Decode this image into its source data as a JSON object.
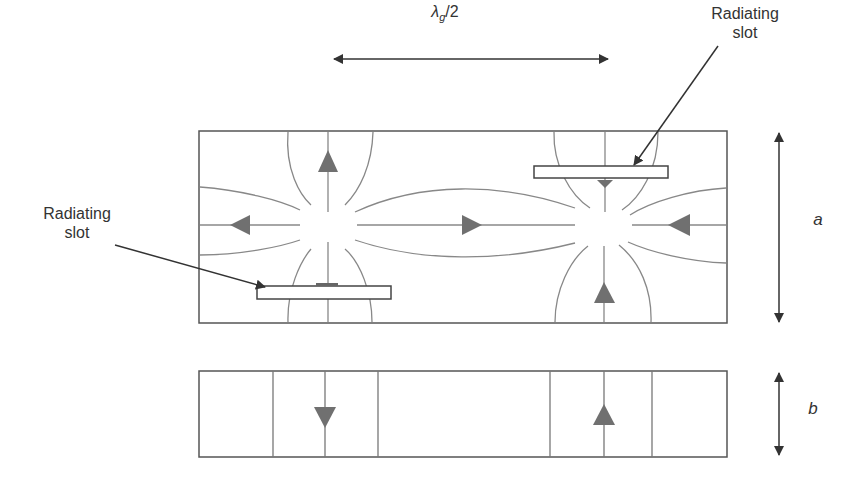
{
  "figure": {
    "labels": {
      "half_wavelength": "λg/2",
      "radiating_slot_right_line1": "Radiating",
      "radiating_slot_right_line2": "slot",
      "radiating_slot_left_line1": "Radiating",
      "radiating_slot_left_line2": "slot",
      "dimension_a": "a",
      "dimension_b": "b"
    },
    "colors": {
      "outline": "#555555",
      "field_lines": "#808080",
      "arrows": "#707070",
      "text": "#333333",
      "background": "#ffffff"
    },
    "top_view": {
      "field_centers": [
        {
          "x": 328,
          "y": 227,
          "direction": "outward"
        },
        {
          "x": 605,
          "y": 227,
          "direction": "inward"
        }
      ],
      "slots": [
        {
          "name": "left-slot",
          "x": 257,
          "y": 286,
          "w": 134,
          "h": 13
        },
        {
          "name": "right-slot",
          "x": 534,
          "y": 166,
          "w": 134,
          "h": 12
        }
      ]
    },
    "side_view": {
      "arrows": [
        {
          "x": 325,
          "direction": "down"
        },
        {
          "x": 604,
          "direction": "up"
        }
      ]
    }
  }
}
